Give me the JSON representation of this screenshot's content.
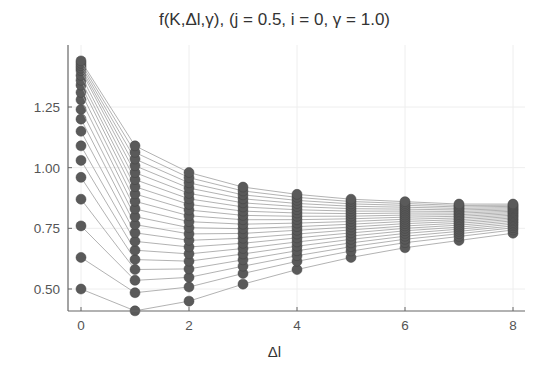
{
  "chart_data": {
    "type": "line",
    "title": "f(K,Δl,γ), (j = 0.5, i = 0, γ = 1.0)",
    "xlabel": "Δl",
    "ylabel": "",
    "x": [
      0,
      1,
      2,
      3,
      4,
      5,
      6,
      7,
      8
    ],
    "xticks": [
      "0",
      "2",
      "4",
      "6",
      "8"
    ],
    "yticks": [
      "0.50",
      "0.75",
      "1.00",
      "1.25"
    ],
    "xlim": [
      -0.2,
      8.2
    ],
    "ylim": [
      0.38,
      1.47
    ],
    "grid": true,
    "legend": "none",
    "marker": "circle",
    "series_count": 20,
    "column_ranges": {
      "x0": [
        0.5,
        1.44
      ],
      "x1": [
        0.41,
        1.09
      ],
      "x2": [
        0.45,
        0.98
      ],
      "x3": [
        0.52,
        0.92
      ],
      "x4": [
        0.58,
        0.89
      ],
      "x5": [
        0.63,
        0.87
      ],
      "x6": [
        0.67,
        0.86
      ],
      "x7": [
        0.7,
        0.85
      ],
      "x8": [
        0.73,
        0.85
      ]
    },
    "start_values": [
      0.5,
      0.63,
      0.76,
      0.87,
      0.96,
      1.03,
      1.09,
      1.15,
      1.2,
      1.24,
      1.28,
      1.31,
      1.34,
      1.36,
      1.38,
      1.4,
      1.41,
      1.42,
      1.43,
      1.44
    ]
  },
  "title": "f(K,Δl,γ), (j = 0.5, i = 0, γ = 1.0)",
  "xlabel": "Δl",
  "colors": {
    "marker": "#5a5a5a",
    "line": "#9a9a9a",
    "axis": "#666666",
    "grid": "#eeeeee"
  }
}
